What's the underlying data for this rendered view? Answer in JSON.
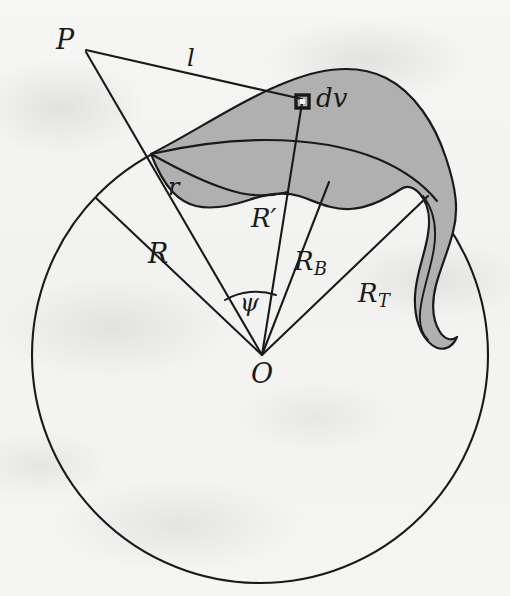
{
  "figure": {
    "type": "geometry-diagram",
    "background_color": "#f4f4f2",
    "ink_color": "#1a1a1a",
    "shade_fill_color": "#b0b0b0",
    "shade_stroke_color": "#1a1a1a",
    "canvas": {
      "width": 510,
      "height": 596
    }
  },
  "points": {
    "P": {
      "label": "P",
      "x": 82,
      "y": 48,
      "role": "external observer point"
    },
    "O": {
      "label": "O",
      "x": 262,
      "y": 355,
      "role": "sphere center / origin"
    },
    "dv": {
      "label": "dv",
      "x": 302,
      "y": 101,
      "role": "volume element marker"
    }
  },
  "labels": {
    "P": "P",
    "l": "l",
    "dv": "dv",
    "r": "r",
    "R_prime": "R′",
    "R": "R",
    "R_B_main": "R",
    "R_B_sub": "B",
    "R_T_main": "R",
    "R_T_sub": "T",
    "psi": "ψ",
    "O": "O"
  },
  "segments": [
    {
      "name": "l",
      "label": "l",
      "from": "P",
      "to": "dv",
      "description": "path length from observer P to volume element dv"
    },
    {
      "name": "r",
      "label": "r",
      "from": "O",
      "to": "P",
      "description": "radial distance from center O out through P"
    },
    {
      "name": "R",
      "label": "R",
      "from": "O",
      "to": "circle-left",
      "description": "sphere radius toward lower-left"
    },
    {
      "name": "R'",
      "label": "R′",
      "from": "O",
      "to": "dv",
      "description": "radial distance from center O to volume element dv"
    },
    {
      "name": "RB",
      "label": "R_B",
      "from": "O",
      "to": "cloud-base",
      "description": "radius to the bottom of the cloud layer"
    },
    {
      "name": "RT",
      "label": "R_T",
      "from": "O",
      "to": "cloud-top",
      "description": "radius to the top of the cloud layer"
    }
  ],
  "angle": {
    "name": "psi",
    "label": "ψ",
    "vertex": "O",
    "between": [
      "r",
      "R'"
    ],
    "description": "angle at the center between the observer direction r and the element direction R'"
  },
  "circle": {
    "name": "planet-sphere",
    "center_x": 260,
    "center_y": 355,
    "radius": 228,
    "stroke": "#1a1a1a",
    "fill": "none"
  },
  "shaded_region": {
    "name": "cloud-layer",
    "fill": "#b0b0b0",
    "stroke": "#1a1a1a",
    "description": "crescent shaped shaded atmospheric cloud layer spanning the upper-right limb of the sphere, with a curling tail extending beyond the limb"
  }
}
